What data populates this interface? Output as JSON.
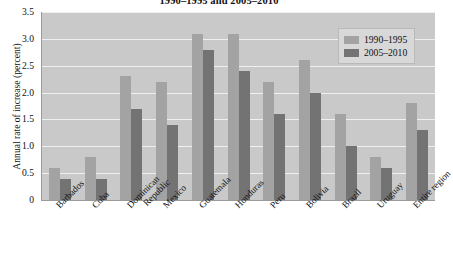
{
  "chart_data": {
    "type": "bar",
    "title": "1990–1995 and 2005–2010",
    "xlabel": "",
    "ylabel": "Annual rate of increase (percent)",
    "ylim": [
      0,
      3.5
    ],
    "yticks": [
      "0",
      "0.5",
      "1.0",
      "1.5",
      "2.0",
      "2.5",
      "3.0",
      "3.5"
    ],
    "ytick_values": [
      0,
      0.5,
      1.0,
      1.5,
      2.0,
      2.5,
      3.0,
      3.5
    ],
    "grid": true,
    "legend_position": "top-right",
    "categories": [
      "Barbados",
      "Cuba",
      "Dominican Republic",
      "Mexico",
      "Guatemala",
      "Honduras",
      "Peru",
      "Bolivia",
      "Brazil",
      "Uruguay",
      "Entire region"
    ],
    "categories_lines": [
      [
        "Barbados"
      ],
      [
        "Cuba"
      ],
      [
        "Dominican",
        "Republic"
      ],
      [
        "Mexico"
      ],
      [
        "Guatemala"
      ],
      [
        "Honduras"
      ],
      [
        "Peru"
      ],
      [
        "Bolivia"
      ],
      [
        "Brazil"
      ],
      [
        "Uruguay"
      ],
      [
        "Entire region"
      ]
    ],
    "series": [
      {
        "name": "1990–1995",
        "color": "#a3a3a3",
        "values": [
          0.6,
          0.8,
          2.3,
          2.2,
          3.1,
          3.1,
          2.2,
          2.6,
          1.6,
          0.8,
          1.8
        ]
      },
      {
        "name": "2005–2010",
        "color": "#737373",
        "values": [
          0.4,
          0.4,
          1.7,
          1.4,
          2.8,
          2.4,
          1.6,
          2.0,
          1.0,
          0.6,
          1.3
        ]
      }
    ],
    "plot_background": "#c9c9c9",
    "gridline_color": "#efefef"
  }
}
